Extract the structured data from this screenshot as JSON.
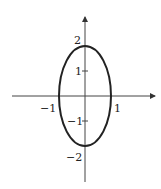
{
  "diagram": {
    "type": "ellipse-plot",
    "equation_shape": "vertical ellipse centered at origin",
    "x_axis": {
      "ticks": [
        {
          "value": -1,
          "label": "−1"
        },
        {
          "value": 1,
          "label": "1"
        }
      ]
    },
    "y_axis": {
      "ticks": [
        {
          "value": 2,
          "label": "2"
        },
        {
          "value": 1,
          "label": "1"
        },
        {
          "value": -1,
          "label": "−1"
        },
        {
          "value": -2,
          "label": "−2"
        }
      ]
    },
    "ellipse": {
      "semi_axis_x": 1,
      "semi_axis_y": 2
    },
    "colors": {
      "stroke": "#222222",
      "axis": "#444444",
      "background": "#ffffff"
    }
  }
}
